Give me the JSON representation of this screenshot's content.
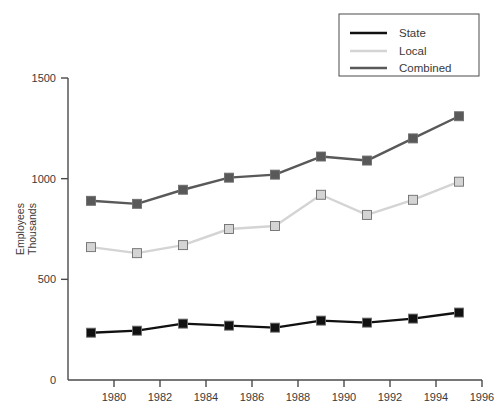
{
  "chart_data": {
    "type": "line",
    "title": "",
    "xlabel": "",
    "ylabel": "Employees\nThousands",
    "ylabel_lines": [
      "Employees",
      "Thousands"
    ],
    "x": [
      1979,
      1981,
      1983,
      1985,
      1987,
      1989,
      1991,
      1993,
      1995
    ],
    "xlim": [
      1978,
      1996
    ],
    "ylim": [
      0,
      1500
    ],
    "xticks": [
      1980,
      1982,
      1984,
      1986,
      1988,
      1990,
      1992,
      1994,
      1996
    ],
    "yticks": [
      0,
      500,
      1000,
      1500
    ],
    "grid": false,
    "legend_position": "top-right",
    "series": [
      {
        "name": "State",
        "color": "#111111",
        "marker": "square",
        "values": [
          235,
          245,
          280,
          270,
          260,
          295,
          285,
          305,
          335
        ]
      },
      {
        "name": "Local",
        "color": "#d4d4d4",
        "marker": "square",
        "values": [
          660,
          630,
          670,
          750,
          765,
          920,
          820,
          895,
          985
        ]
      },
      {
        "name": "Combined",
        "color": "#595959",
        "marker": "square",
        "values": [
          890,
          875,
          945,
          1005,
          1020,
          1110,
          1090,
          1200,
          1310
        ]
      }
    ]
  },
  "legend": {
    "items": [
      {
        "label": "State"
      },
      {
        "label": "Local"
      },
      {
        "label": "Combined"
      }
    ]
  },
  "axes": {
    "y_title_line1": "Employees",
    "y_title_line2": "Thousands",
    "y_tick_labels": [
      "0",
      "500",
      "1000",
      "1500"
    ],
    "x_tick_labels": [
      "1980",
      "1982",
      "1984",
      "1986",
      "1988",
      "1990",
      "1992",
      "1994",
      "1996"
    ]
  },
  "colors": {
    "state": "#111111",
    "local": "#d4d4d4",
    "combined": "#595959",
    "axis": "#4a4a4a",
    "text": "#3a3a3a",
    "background": "#ffffff"
  }
}
